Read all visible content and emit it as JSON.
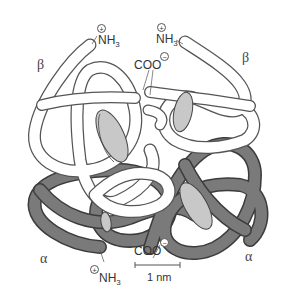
{
  "figure": {
    "colors": {
      "beta_chain_fill": "#ffffff",
      "beta_chain_stroke": "#555555",
      "alpha_chain_fill": "#7a7a7a",
      "alpha_chain_stroke": "#3c3c3c",
      "heme_fill": "#c8c8c8",
      "heme_stroke": "#444444",
      "background": "#ffffff"
    },
    "labels": {
      "beta_left": "β",
      "beta_right": "β",
      "alpha_left": "α",
      "alpha_right": "α",
      "nh3_top_left": "NH",
      "nh3_top_left_sub": "3",
      "nh3_top_right": "NH",
      "nh3_top_right_sub": "3",
      "nh3_bottom": "NH",
      "nh3_bottom_sub": "3",
      "coo_top": "COO",
      "coo_bottom": "COO",
      "plus_charge": "+",
      "minus_charge": "−"
    },
    "scale_bar": {
      "label": "1 nm"
    }
  }
}
